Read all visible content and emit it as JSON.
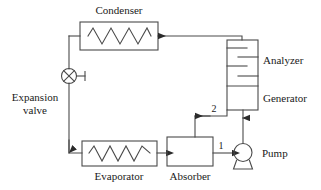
{
  "diagram": {
    "colors": {
      "line": "#4a4a4a",
      "text": "#1a1a1a",
      "background": "#ffffff"
    },
    "components": {
      "condenser": {
        "label": "Condenser",
        "type": "heat-exchanger-coil"
      },
      "expansion_valve": {
        "label_line1": "Expansion",
        "label_line2": "valve",
        "type": "cross-circle-valve"
      },
      "evaporator": {
        "label": "Evaporator",
        "type": "heat-exchanger-coil"
      },
      "absorber": {
        "label": "Absorber",
        "type": "box"
      },
      "pump": {
        "label": "Pump",
        "type": "centrifugal-pump"
      },
      "generator": {
        "label": "Generator",
        "type": "column-section"
      },
      "analyzer": {
        "label": "Analyzer",
        "type": "tray-column"
      }
    },
    "stream_labels": {
      "pump_inlet": "1",
      "absorber_inlet": "2"
    }
  }
}
